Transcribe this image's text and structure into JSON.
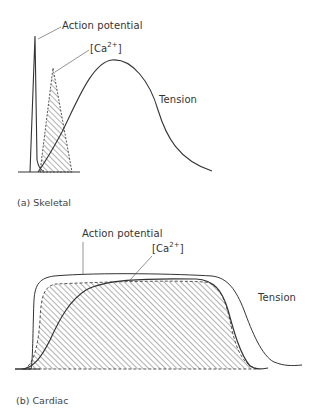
{
  "panels": [
    {
      "id": "skeletal",
      "caption": "(a)  Skeletal",
      "labels": {
        "action_potential": "Action potential",
        "calcium_prefix": "[Ca",
        "calcium_sup": "2+",
        "calcium_suffix": "]",
        "tension": "Tension"
      }
    },
    {
      "id": "cardiac",
      "caption": "(b)  Cardiac",
      "labels": {
        "action_potential": "Action potential",
        "calcium_prefix": "[Ca",
        "calcium_sup": "2+",
        "calcium_suffix": "]",
        "tension": "Tension"
      }
    }
  ],
  "colors": {
    "line": "#333333",
    "hatch": "#555555",
    "background": "#ffffff"
  }
}
